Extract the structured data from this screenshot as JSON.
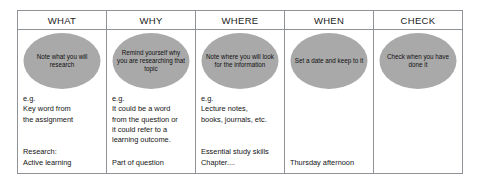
{
  "diagram": {
    "type": "table",
    "accent_bubble_color": "#a9a9a9",
    "border_color": "#8f9296",
    "background_color": "#ffffff",
    "columns": [
      {
        "header": "WHAT",
        "bubble": "Note what you\nwill research",
        "notes": "e.g.\nKey word from\nthe assignment",
        "example": "Research:\nActive learning"
      },
      {
        "header": "WHY",
        "bubble": "Remind yourself\nwhy you are\nresearching\nthat topic",
        "notes": "e.g.\nIt could be a word\nfrom the question or\nit could refer to a\nlearning outcome.",
        "example": "Part of question"
      },
      {
        "header": "WHERE",
        "bubble": "Note where you\nwill look for the\ninformation",
        "notes": "e.g.\nLecture notes,\nbooks, journals, etc.",
        "example": "Essential study skills\n   Chapter...."
      },
      {
        "header": "WHEN",
        "bubble": "Set a date and\nkeep to it",
        "notes": "",
        "example": "Thursday afternoon"
      },
      {
        "header": "CHECK",
        "bubble": "Check when you\nhave done it",
        "notes": "",
        "example": ""
      }
    ]
  }
}
